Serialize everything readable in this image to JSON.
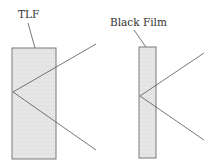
{
  "diagram": {
    "panels": [
      {
        "label": "TLF",
        "description": "thick lamellar film"
      },
      {
        "label": "Black Film",
        "description": "thin black film"
      }
    ],
    "colors": {
      "film_fill": "#e4e4e4",
      "film_stroke": "#7a7a7a",
      "ray": "#555555",
      "text": "#333333"
    }
  }
}
